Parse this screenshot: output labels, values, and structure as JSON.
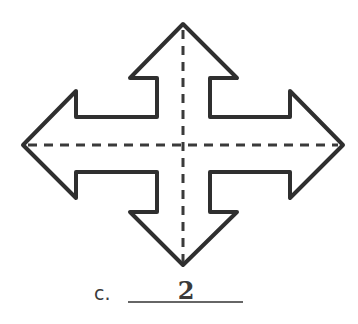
{
  "figure": {
    "shape": "four-headed-arrow",
    "symmetry_lines": [
      "vertical",
      "horizontal"
    ],
    "line_of_symmetry_count": 2
  },
  "question": {
    "label": "c.",
    "answer": "2"
  },
  "colors": {
    "stroke": "#2f2f2f",
    "background": "#ffffff"
  }
}
